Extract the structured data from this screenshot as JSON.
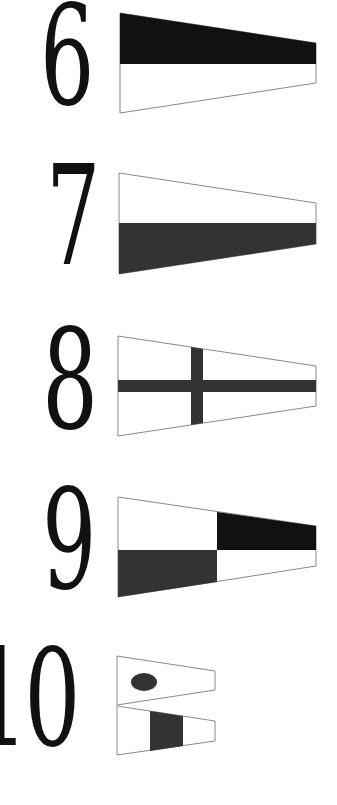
{
  "colors": {
    "background": "#ffffff",
    "numeral": "#111111",
    "black": "#111111",
    "dark": "#333333",
    "outline": "#888888",
    "white": "#ffffff"
  },
  "flags": [
    {
      "numeral": "6",
      "description": "Pennant: top half black, bottom half white"
    },
    {
      "numeral": "7",
      "description": "Pennant: top half white, bottom half dark"
    },
    {
      "numeral": "8",
      "description": "Pennant: white with dark cross"
    },
    {
      "numeral": "9",
      "description": "Pennant: quartered — top-left white, top-right black, bottom-left dark, bottom-right white"
    },
    {
      "numeral": "10",
      "description": "Two stacked pennants: top with dark dot (1), bottom white with dark vertical band (0)"
    }
  ]
}
